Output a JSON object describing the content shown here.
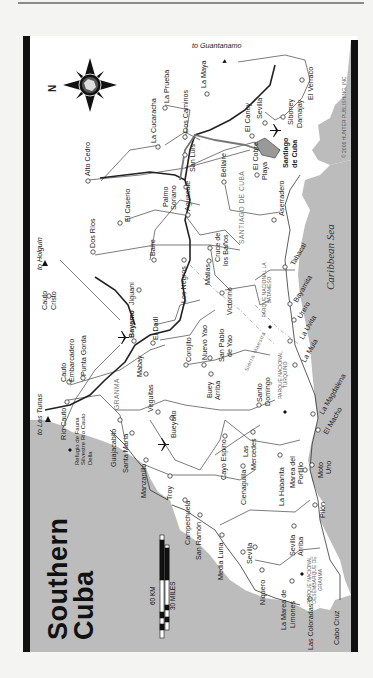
{
  "title": {
    "line1": "Southern",
    "line2": "Cuba"
  },
  "copyright": "© 2006 HUNTER PUBLISHING, INC",
  "scale": {
    "km": "60 KM",
    "miles": "30 MILES"
  },
  "compass": {
    "label": "N",
    "ring_text": "HUNTER PUBLISHING"
  },
  "sea": "Caribbean Sea",
  "directions": {
    "guantanamo": "to Guantanamo",
    "holguin": "to Holguín",
    "las_tunas": "to Las Tunas"
  },
  "regions": {
    "santiago": "SANTIAGO DE CUBA",
    "granma": "GRANMA",
    "sierra": "Sierra Maestra"
  },
  "parks": {
    "batameso": "PARQUE NACIONAL LA BATAMESO",
    "turquino": "PARQUE NACIONAL TURQUINO",
    "granma": "PARQUE NACIONAL DESEMBARQUE DE GRANMA",
    "refugio": "Refugio de Fauna Silvestre Río Cauto Della"
  },
  "places": {
    "la_maya": "La Maya",
    "el_verraco": "El Verraco",
    "la_prueba": "La Prueba",
    "la_cucaracha": "La Cucaracha",
    "dos_caminos": "Dos Caminos",
    "el_caney": "El Caney",
    "sevilla_e": "Sevilla",
    "siboney": "Siboney",
    "damajay": "Damajay",
    "alto_cedro": "Alto Cedro",
    "san_luis": "San Luis",
    "santiago": "Santiago",
    "de_cuba": "de Cuba",
    "bellaire": "Bellaire",
    "el_cobre": "El Cobre",
    "playa": "Playa",
    "palmo": "Palmo",
    "soriano": "Soriano",
    "el_caserio": "El Caserio",
    "aguacate": "Aguacate",
    "baire": "Baire",
    "dos_rios": "Dos Ríos",
    "aserradero": "Aserradero",
    "tabacal": "Tabacal",
    "cruce": "Cruce de",
    "los_banos": "los Baños",
    "matias": "Matias",
    "los_negros": "Los Negros",
    "victorino": "Victorino",
    "cauto": "Cauto",
    "cristo": "Cristo",
    "bayamo": "Bayamo",
    "jiguani": "Jiguani",
    "bayamita": "Bayamita",
    "urero": "Urero",
    "la_uvita": "La Uvita",
    "la_mula": "La Mula",
    "el_dadl": "El Dadl",
    "corojito": "Corojito",
    "nuevo_yao": "Nuevo Yao",
    "san_pablo": "San Pablo",
    "de_yao": "de Yao",
    "cauto_emb": "Cauto",
    "embarcadero": "Embarcadero",
    "punta_gorda": "Punta Gorda",
    "mabay": "Mabay",
    "buey": "Buey",
    "arriba": "Arriba",
    "santo": "Santo",
    "domingo": "Domingo",
    "la_magdalena": "La Magdalena",
    "el_macho": "El Macho",
    "rio_cauto": "Río Cauto",
    "veguitas": "Veguitas",
    "guisa": "Guajacabito",
    "bueycito": "Bueycito",
    "santa_maria": "Santa María",
    "cayo_espino": "Cayo Espino",
    "las": "Las",
    "mercedes": "Mercedes",
    "manzanillo": "Manzanillo",
    "cienaguilla": "Cienaguilla",
    "la_habanita": "La Habanita",
    "marea": "Marea del",
    "portillo": "Portillo",
    "ocujal": "Moto",
    "uno": "Uno",
    "troy": "Troy",
    "pilon": "Pilón",
    "campechuela": "Campechuela",
    "san_ramon": "San Ramón",
    "media_luna": "Media Luna",
    "sevilla_w": "Sevilla",
    "sevilla_arriba": "Sevilla",
    "arriba2": "Arriba",
    "niquero": "Niquero",
    "la_marea": "La Marea de",
    "limones": "Limones",
    "las_coloradas": "Las Coloradas",
    "cabo_cruz": "Cabo Cruz"
  },
  "colors": {
    "sea": "#b9b9b9",
    "land": "#ffffff",
    "frame": "#111111",
    "road": "#222222",
    "highway": "#555555"
  }
}
